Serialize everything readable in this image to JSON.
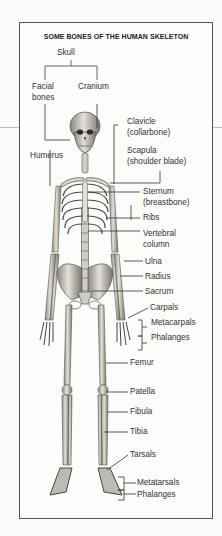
{
  "figure": {
    "title": "SOME BONES OF THE HUMAN SKELETON",
    "skull_group": {
      "label": "Skull",
      "children": [
        "Facial bones",
        "Cranium"
      ]
    },
    "labels": {
      "skull": "Skull",
      "facial_1": "Facial",
      "facial_2": "bones",
      "cranium": "Cranium",
      "clavicle_1": "Clavicle",
      "clavicle_2": "(collarbone)",
      "humerus": "Humerus",
      "scapula_1": "Scapula",
      "scapula_2": "(shoulder blade)",
      "sternum_1": "Sternum",
      "sternum_2": "(breastbone)",
      "ribs": "Ribs",
      "vertebral_1": "Vertebral",
      "vertebral_2": "column",
      "ulna": "Ulna",
      "radius": "Radius",
      "sacrum": "Sacrum",
      "carpals": "Carpals",
      "metacarpals": "Metacarpals",
      "phalanges_hand": "Phalanges",
      "femur": "Femur",
      "patella": "Patella",
      "fibula": "Fibula",
      "tibia": "Tibia",
      "tarsals": "Tarsals",
      "metatarsals": "Metatarsals",
      "phalanges_foot": "Phalanges"
    },
    "colors": {
      "frame": "#555555",
      "bone": "#d9d6cf",
      "bone_shadow": "#6f6c66",
      "text": "#333333"
    }
  }
}
